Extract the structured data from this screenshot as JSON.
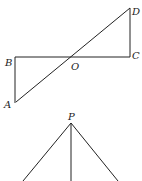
{
  "figure1": {
    "labels": {
      "A": "A",
      "B": "B",
      "C": "C",
      "D": "D",
      "O": "O"
    },
    "segments": [
      "AB",
      "BC",
      "CD",
      "AD"
    ]
  },
  "figure2": {
    "labels": {
      "P": "P"
    },
    "segments": [
      "P-left",
      "P-down",
      "P-right"
    ]
  }
}
